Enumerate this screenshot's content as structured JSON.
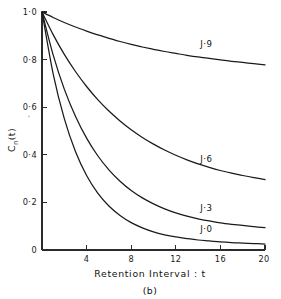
{
  "chart_data": {
    "type": "line",
    "title": "",
    "subtitle": "",
    "panel_caption": "(b)",
    "xlabel": "Retention Interval : t",
    "ylabel": "C_n(t)",
    "ylabel_base": "C",
    "ylabel_subscript": "n",
    "ylabel_arg": "(t)",
    "ylabel_prime_mark": "′",
    "xlim": [
      0,
      20
    ],
    "ylim": [
      0,
      1.0
    ],
    "grid": false,
    "legend_position": "inline-curve-labels",
    "xticks": [
      0,
      4,
      8,
      12,
      16,
      20
    ],
    "xtick_labels": [
      "0",
      "4",
      "8",
      "12",
      "16",
      "20"
    ],
    "yticks": [
      0,
      0.2,
      0.4,
      0.6,
      0.8,
      1.0
    ],
    "ytick_labels": [
      "0",
      "0·2",
      "0·4",
      "0·6",
      "0·8",
      "1·0"
    ],
    "x": [
      0,
      1,
      2,
      3,
      4,
      5,
      6,
      7,
      8,
      9,
      10,
      11,
      12,
      13,
      14,
      15,
      16,
      17,
      18,
      19,
      20
    ],
    "series": [
      {
        "name": "J=9",
        "label": "J·9",
        "label_x": 14.2,
        "label_y": 0.855,
        "values": [
          1.0,
          0.977,
          0.956,
          0.937,
          0.92,
          0.904,
          0.889,
          0.876,
          0.864,
          0.853,
          0.843,
          0.834,
          0.826,
          0.818,
          0.811,
          0.805,
          0.799,
          0.793,
          0.788,
          0.783,
          0.778
        ]
      },
      {
        "name": "J=6",
        "label": "J·6",
        "label_x": 14.2,
        "label_y": 0.37,
        "values": [
          1.0,
          0.905,
          0.822,
          0.75,
          0.687,
          0.632,
          0.584,
          0.542,
          0.505,
          0.473,
          0.445,
          0.42,
          0.398,
          0.379,
          0.362,
          0.347,
          0.334,
          0.323,
          0.313,
          0.304,
          0.296
        ]
      },
      {
        "name": "J=3",
        "label": "J·3",
        "label_x": 14.2,
        "label_y": 0.165,
        "values": [
          1.0,
          0.82,
          0.676,
          0.562,
          0.47,
          0.396,
          0.337,
          0.289,
          0.25,
          0.219,
          0.194,
          0.173,
          0.156,
          0.142,
          0.131,
          0.122,
          0.114,
          0.108,
          0.103,
          0.098,
          0.094
        ]
      },
      {
        "name": "J=0",
        "label": "J·0",
        "label_x": 14.2,
        "label_y": 0.075,
        "values": [
          1.0,
          0.74,
          0.552,
          0.414,
          0.313,
          0.239,
          0.185,
          0.145,
          0.115,
          0.093,
          0.076,
          0.064,
          0.055,
          0.048,
          0.042,
          0.038,
          0.034,
          0.031,
          0.029,
          0.027,
          0.025
        ]
      }
    ],
    "colors": {
      "curve": "#1a1a1a",
      "axis": "#2b2b2b",
      "text": "#111111",
      "background": "#ffffff"
    }
  }
}
